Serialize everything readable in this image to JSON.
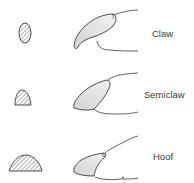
{
  "diagram": {
    "rows": [
      {
        "label": "Claw",
        "cross_section": "narrow-oval",
        "profile": "curved-pointed-claw"
      },
      {
        "label": "Semiclaw",
        "cross_section": "small-dome",
        "profile": "semi-claw"
      },
      {
        "label": "Hoof",
        "cross_section": "wide-dome",
        "profile": "hoof"
      }
    ]
  },
  "colors": {
    "stroke": "#3a3a3a",
    "fill": "#e6e6e6",
    "hatch": "#555555",
    "text": "#3a3a3a"
  }
}
